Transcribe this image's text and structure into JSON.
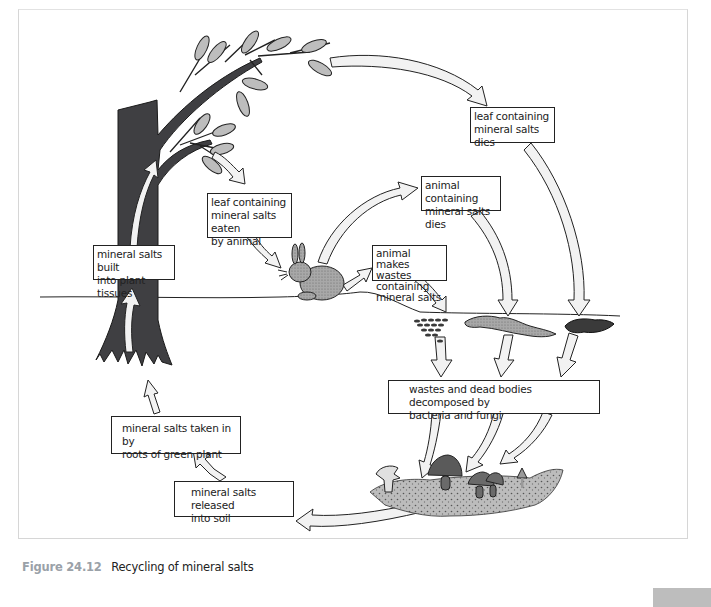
{
  "figure": {
    "number": "Figure 24.12",
    "title": "Recycling of mineral salts"
  },
  "labels": {
    "leaf_dies": [
      "leaf containing",
      "mineral salts dies"
    ],
    "leaf_eaten": [
      "leaf containing",
      "mineral salts eaten",
      "by animal"
    ],
    "animal_dies": [
      "animal containing",
      "mineral salts dies"
    ],
    "animal_wastes": [
      "animal makes",
      "wastes containing",
      "mineral salts"
    ],
    "built_into_tissues": [
      "mineral salts built",
      "into plant tissues"
    ],
    "decomposed": [
      "wastes and dead bodies decomposed by",
      "bacteria and fungi"
    ],
    "taken_in_by_roots": [
      "mineral salts taken in by",
      "roots of green plant"
    ],
    "released_into_soil": [
      "mineral salts released",
      "into soil"
    ]
  },
  "illustrations": {
    "tree": "tree-with-leaves",
    "animal": "rabbit",
    "dead_matter": [
      "animal-wastes",
      "dead-animal-body",
      "dead-leaf"
    ],
    "decomposers": "mushrooms-on-soil"
  },
  "colors": {
    "outline": "#222222",
    "arrow_fill": "#f2f2f2",
    "tree_trunk": "#3f3f42",
    "leaf_fill": "#bdbdbd",
    "rabbit_fill": "#a9a9a9",
    "caption_figure": "#9aa1a8",
    "page_bar": "#bdbdbd"
  }
}
